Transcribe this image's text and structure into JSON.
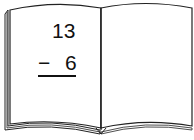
{
  "problem": {
    "minuend": "13",
    "operator": "−",
    "subtrahend": "6",
    "operation": "subtraction"
  },
  "book": {
    "left_page": "vertical subtraction problem",
    "right_page": "blank"
  },
  "colors": {
    "page": "#ffffff",
    "ink": "#111111",
    "outline": "#222222"
  }
}
